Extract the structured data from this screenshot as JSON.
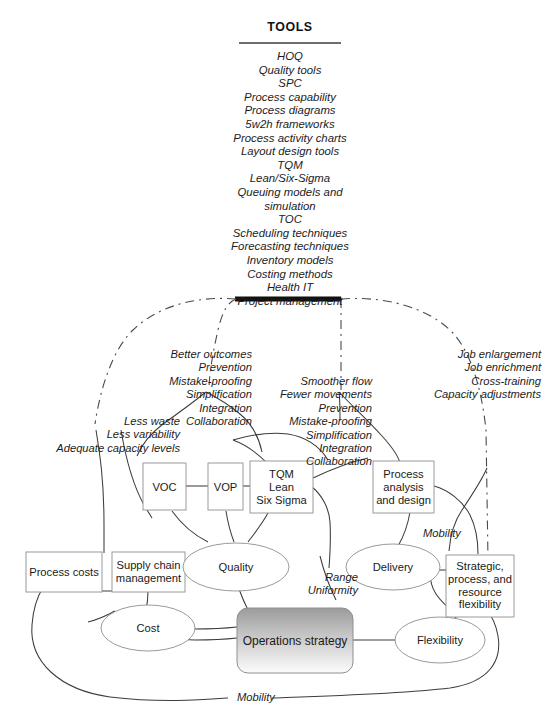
{
  "diagram": {
    "tools_panel": {
      "heading": "TOOLS",
      "items_text": "HOQ\nQuality tools\nSPC\nProcess capability\nProcess diagrams\n5w2h frameworks\nProcess activity charts\nLayout design tools\nTQM\nLean/Six-Sigma\nQueuing models and\nsimulation\nTOC\nScheduling techniques\nForecasting techniques\nInventory models\nCosting methods\nHealth IT\nProject management",
      "items": [
        "HOQ",
        "Quality tools",
        "SPC",
        "Process capability",
        "Process diagrams",
        "5w2h frameworks",
        "Process activity charts",
        "Layout design tools",
        "TQM",
        "Lean/Six-Sigma",
        "Queuing models and simulation",
        "TOC",
        "Scheduling techniques",
        "Forecasting techniques",
        "Inventory models",
        "Costing methods",
        "Health IT",
        "Project management"
      ]
    },
    "annotations": {
      "cost_group": "Less waste\nLess variability\nAdequate capacity levels",
      "quality_group": "Better outcomes\nPrevention\nMistake-proofing\nSimplification\nIntegration\nCollaboration",
      "delivery_group": "Smoother flow\nFewer movements\nPrevention\nMistake-proofing\nSimplification\nIntegration\nCollaboration",
      "flexibility_group": "Job enlargement\nJob enrichment\nCross-training\nCapacity adjustments",
      "range_uniformity": "Range\nUniformity",
      "mobility_upper": "Mobility",
      "mobility_lower": "Mobility"
    },
    "nodes": {
      "voc": "VOC",
      "vop": "VOP",
      "tqm": "TQM\nLean\nSix Sigma",
      "process_analysis": "Process\nanalysis\nand design",
      "process_costs": "Process costs",
      "supply_chain": "Supply chain\nmanagement",
      "strategic_flexibility": "Strategic,\nprocess, and\nresource\nflexibility",
      "quality": "Quality",
      "delivery": "Delivery",
      "cost": "Cost",
      "flexibility": "Flexibility",
      "operations_strategy": "Operations strategy"
    },
    "colors": {
      "line": "#3d3d3d",
      "box_border": "#9a9a9a",
      "text": "#1a1a1a",
      "os_fill_top": "#9e9e9e",
      "os_fill_bottom": "#ffffff",
      "bar": "#111111"
    }
  }
}
